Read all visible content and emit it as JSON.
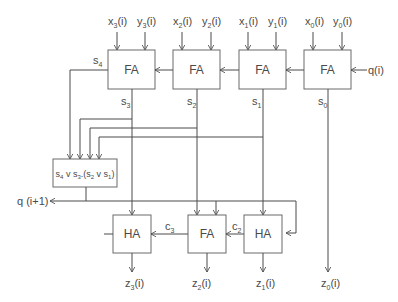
{
  "diagram": {
    "type": "circuit",
    "full_adders": [
      {
        "id": "fa3",
        "label": "FA",
        "inputs": [
          "x_3(i)",
          "y_3(i)"
        ],
        "carry_out": "s_4",
        "sum_out": "s_3"
      },
      {
        "id": "fa2",
        "label": "FA",
        "inputs": [
          "x_2(i)",
          "y_2(i)"
        ],
        "sum_out": "s_2"
      },
      {
        "id": "fa1",
        "label": "FA",
        "inputs": [
          "x_1(i)",
          "y_1(i)"
        ],
        "sum_out": "s_1"
      },
      {
        "id": "fa0",
        "label": "FA",
        "inputs": [
          "x_0(i)",
          "y_0(i)"
        ],
        "carry_in": "q(i)",
        "sum_out": "s_0"
      }
    ],
    "logic_box": {
      "label": "s4 v s3.(s2 v s1)",
      "output": "q (i+1)"
    },
    "lower": [
      {
        "id": "ha3",
        "label": "HA",
        "output": "z_3(i)"
      },
      {
        "id": "fa_low",
        "label": "FA",
        "output": "z_2(i)",
        "carry_out": "c_3"
      },
      {
        "id": "ha1",
        "label": "HA",
        "output": "z_1(i)",
        "carry_out": "c_2"
      }
    ],
    "direct_output": "z_0(i)"
  },
  "labels": {
    "x3": "x",
    "x3sub": "3",
    "y3": "y",
    "y3sub": "3",
    "x2": "x",
    "x2sub": "2",
    "y2": "y",
    "y2sub": "2",
    "x1": "x",
    "x1sub": "1",
    "y1": "y",
    "y1sub": "1",
    "x0": "x",
    "x0sub": "0",
    "y0": "y",
    "y0sub": "0",
    "arg": "(i)",
    "fa": "FA",
    "ha": "HA",
    "qi": "q(i)",
    "qnext": "q (i+1)",
    "s": "s",
    "c": "c",
    "z": "z",
    "sub4": "4",
    "sub3": "3",
    "sub2": "2",
    "sub1": "1",
    "sub0": "0"
  }
}
